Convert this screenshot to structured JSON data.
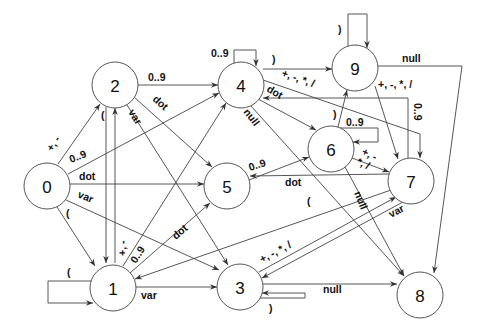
{
  "diagram": {
    "type": "state-transition",
    "nodes": [
      {
        "id": "0",
        "label": "0",
        "x": 47,
        "y": 186
      },
      {
        "id": "1",
        "label": "1",
        "x": 113,
        "y": 288
      },
      {
        "id": "2",
        "label": "2",
        "x": 115,
        "y": 85
      },
      {
        "id": "3",
        "label": "3",
        "x": 240,
        "y": 287
      },
      {
        "id": "4",
        "label": "4",
        "x": 241,
        "y": 85
      },
      {
        "id": "5",
        "label": "5",
        "x": 227,
        "y": 186
      },
      {
        "id": "6",
        "label": "6",
        "x": 331,
        "y": 149
      },
      {
        "id": "7",
        "label": "7",
        "x": 411,
        "y": 181
      },
      {
        "id": "8",
        "label": "8",
        "x": 420,
        "y": 295
      },
      {
        "id": "9",
        "label": "9",
        "x": 355,
        "y": 68
      }
    ],
    "edges": [
      {
        "from": "0",
        "to": "2",
        "label": "+, -"
      },
      {
        "from": "0",
        "to": "4",
        "label": "0..9"
      },
      {
        "from": "0",
        "to": "5",
        "label": "dot"
      },
      {
        "from": "0",
        "to": "3",
        "label": "var"
      },
      {
        "from": "0",
        "to": "1",
        "label": "("
      },
      {
        "from": "1",
        "to": "1",
        "label": "("
      },
      {
        "from": "1",
        "to": "2",
        "label": "+, -"
      },
      {
        "from": "2",
        "to": "1",
        "label": "("
      },
      {
        "from": "1",
        "to": "4",
        "label": "0..9"
      },
      {
        "from": "1",
        "to": "5",
        "label": "dot"
      },
      {
        "from": "1",
        "to": "3",
        "label": "var"
      },
      {
        "from": "2",
        "to": "4",
        "label": "0..9"
      },
      {
        "from": "2",
        "to": "5",
        "label": "dot"
      },
      {
        "from": "2",
        "to": "3",
        "label": "var"
      },
      {
        "from": "4",
        "to": "4",
        "label": "0..9"
      },
      {
        "from": "4",
        "to": "9",
        "label": ")"
      },
      {
        "from": "4",
        "to": "7",
        "label": "+, -, *, /"
      },
      {
        "from": "4",
        "to": "6",
        "label": "dot"
      },
      {
        "from": "4",
        "to": "8",
        "label": "null"
      },
      {
        "from": "5",
        "to": "6",
        "label": "0..9"
      },
      {
        "from": "6",
        "to": "6",
        "label": "0..9"
      },
      {
        "from": "6",
        "to": "9",
        "label": ")"
      },
      {
        "from": "6",
        "to": "7",
        "label": "+, -, *, /"
      },
      {
        "from": "6",
        "to": "8",
        "label": "null"
      },
      {
        "from": "7",
        "to": "5",
        "label": "dot"
      },
      {
        "from": "7",
        "to": "4",
        "label": "0..9"
      },
      {
        "from": "7",
        "to": "1",
        "label": "("
      },
      {
        "from": "7",
        "to": "3",
        "label": "var"
      },
      {
        "from": "3",
        "to": "7",
        "label": "+, -, *, /"
      },
      {
        "from": "3",
        "to": "3",
        "label": ")"
      },
      {
        "from": "3",
        "to": "8",
        "label": "null"
      },
      {
        "from": "9",
        "to": "9",
        "label": ")"
      },
      {
        "from": "9",
        "to": "7",
        "label": "+, -, *, /"
      },
      {
        "from": "9",
        "to": "8",
        "label": "null"
      }
    ]
  },
  "labels": {
    "n0": "0",
    "n1": "1",
    "n2": "2",
    "n3": "3",
    "n4": "4",
    "n5": "5",
    "n6": "6",
    "n7": "7",
    "n8": "8",
    "n9": "9",
    "e_0_2": "+, -",
    "e_0_4": "0..9",
    "e_0_5": "dot",
    "e_0_3": "var",
    "e_0_1": "(",
    "e_1_1": "(",
    "e_1_2": "+, -",
    "e_2_1": "(",
    "e_1_4": "0..9",
    "e_1_5": "dot",
    "e_1_3": "var",
    "e_2_4": "0..9",
    "e_2_5": "dot",
    "e_2_3": "var",
    "e_4_4": "0..9",
    "e_4_9": ")",
    "e_4_7": "+, -, *, /",
    "e_4_6": "dot",
    "e_4_8": "null",
    "e_5_6": "0..9",
    "e_6_6": "0..9",
    "e_6_9": ")",
    "e_6_7a": "+, -",
    "e_6_7b": "*, /",
    "e_6_8": "null",
    "e_7_5": "dot",
    "e_7_4": "0..9",
    "e_7_1": "(",
    "e_7_3": "var",
    "e_3_7": "+, -, *, /",
    "e_3_3": ")",
    "e_3_8": "null",
    "e_9_9": ")",
    "e_9_7": "+, -, *, /",
    "e_9_8": "null"
  }
}
